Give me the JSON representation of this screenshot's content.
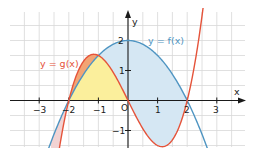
{
  "chart_data": {
    "type": "line",
    "title": "",
    "xlabel": "x",
    "ylabel": "y",
    "xlim": [
      -4,
      4
    ],
    "ylim": [
      -1.6,
      2.9
    ],
    "grid": true,
    "grid_step": 0.5,
    "x_ticks": [
      -3,
      -2,
      -1,
      0,
      1,
      2,
      3
    ],
    "x_tick_labels": [
      "−3",
      "−2",
      "−1",
      "0",
      "1",
      "2",
      "3"
    ],
    "y_ticks": [
      -1,
      1,
      2
    ],
    "y_tick_labels": [
      "−1",
      "1",
      "2"
    ],
    "origin_label": "O",
    "series": [
      {
        "name": "y = f(x)",
        "formula": "f(x) = -0.5x^2 + 2",
        "color": "#4f95c2",
        "x": [
          -2.6,
          -2,
          -1.5,
          -1,
          -0.5,
          0,
          0.5,
          1,
          1.5,
          2,
          2.6
        ],
        "values": [
          -1.38,
          0,
          0.875,
          1.5,
          1.875,
          2,
          1.875,
          1.5,
          0.875,
          0,
          -1.38
        ]
      },
      {
        "name": "y = g(x)",
        "formula": "g(x) = 0.5x^3 - 2x",
        "color": "#e5533a",
        "x": [
          -2.4,
          -2,
          -1.5,
          -1.15,
          -1,
          -0.5,
          0,
          0.5,
          1,
          1.15,
          1.5,
          2,
          2.5
        ],
        "values": [
          -2.11,
          0,
          1.31,
          1.54,
          1.5,
          0.94,
          0,
          -0.94,
          -1.5,
          -1.54,
          -1.31,
          0,
          2.81
        ]
      }
    ],
    "shaded_regions": [
      {
        "name": "region between x-axis and curves on [-2,0]",
        "color": "#fbef9c",
        "x_range": [
          -2,
          0
        ]
      },
      {
        "name": "region between g and f on [-2,-1]",
        "color": "#f3a473",
        "x_range": [
          -2,
          -1
        ]
      },
      {
        "name": "region between f and g on [-1,2]",
        "color": "#d5e7f3",
        "x_range": [
          -1,
          2
        ]
      },
      {
        "name": "region between f and g for x < -2",
        "color": "#f2d3d3",
        "x_range": [
          -2.6,
          -2
        ]
      }
    ],
    "annotations": [
      {
        "text": "y = f(x)",
        "x": 1.0,
        "y": 1.85,
        "color": "#4f95c2"
      },
      {
        "text": "y = g(x)",
        "x": -3.0,
        "y": 1.25,
        "color": "#e5533a"
      }
    ],
    "intersections": [
      [
        -2,
        0
      ],
      [
        -1,
        1.5
      ],
      [
        2,
        0
      ]
    ]
  },
  "labels": {
    "f_curve": "y = f(x)",
    "g_curve": "y = g(x)",
    "x_axis": "x",
    "y_axis": "y",
    "origin": "O",
    "xt_m3": "−3",
    "xt_m2": "−2",
    "xt_m1": "−1",
    "xt_1": "1",
    "xt_2": "2",
    "xt_3": "3",
    "yt_m1": "−1",
    "yt_1": "1",
    "yt_2": "2"
  }
}
